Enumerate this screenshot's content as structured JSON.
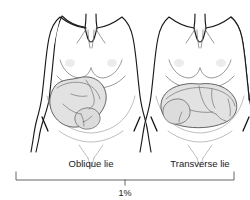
{
  "figure": {
    "background_color": "#ffffff",
    "ink_color": "#1a1a1a",
    "fetus_fill_color": "#e2e2e2",
    "bracket_color": "#555555"
  },
  "panels": [
    {
      "id": "oblique",
      "label": "Oblique lie",
      "fetus_orientation": "diagonal",
      "description": "Fetus lying at an angle across the uterus"
    },
    {
      "id": "transverse",
      "label": "Transverse lie",
      "fetus_orientation": "horizontal",
      "description": "Fetus lying sideways across the uterus"
    }
  ],
  "annotation": {
    "percentage": "1%",
    "bracket_spans_both_panels": true
  }
}
